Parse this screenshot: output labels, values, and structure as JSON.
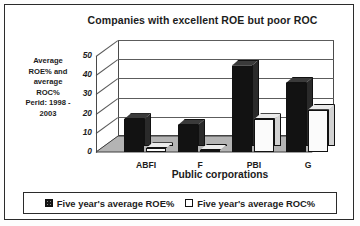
{
  "chart_data": {
    "type": "bar",
    "title": "Companies with excellent ROE but poor ROC",
    "xlabel": "Public corporations",
    "ylabel": "Average ROE% and average ROC% Perid: 1998 - 2003",
    "ylabel_lines": [
      "Average",
      "ROE% and",
      "average",
      "ROC%",
      "Perid: 1998 -",
      "2003"
    ],
    "categories": [
      "ABFI",
      "F",
      "PBI",
      "G"
    ],
    "series": [
      {
        "name": "Five year's average ROE%",
        "values": [
          17,
          14,
          45,
          36
        ],
        "swatch": "dark"
      },
      {
        "name": "Five year's average ROC%",
        "values": [
          2,
          1,
          17,
          22
        ],
        "swatch": "light"
      }
    ],
    "ylim": [
      0,
      50
    ],
    "yticks": [
      0,
      10,
      20,
      30,
      40,
      50
    ],
    "ytick_labels": [
      "0",
      "10",
      "20",
      "30",
      "40",
      "50"
    ],
    "grid": true,
    "legend_position": "bottom",
    "style": "3d-clustered-column",
    "colors": {
      "roe": "#121212",
      "roc": "#fbfbfb",
      "axis": "#4a4a4a",
      "text": "#1c1c1c"
    }
  }
}
